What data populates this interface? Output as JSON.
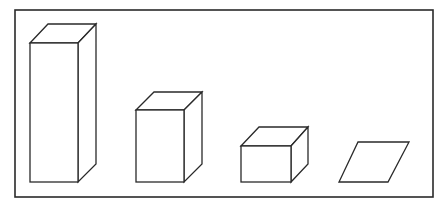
{
  "diagram": {
    "frame": {
      "x": 15,
      "y": 10,
      "width": 418,
      "height": 187
    },
    "line_color": "#2a2a2a",
    "background": "#ffffff",
    "depth_offset": {
      "dx": 18,
      "dy": -18
    },
    "shapes": [
      {
        "name": "tall-prism",
        "front": {
          "x": 30,
          "y": 43,
          "width": 48,
          "height": 139
        }
      },
      {
        "name": "medium-prism",
        "front": {
          "x": 136,
          "y": 110,
          "width": 48,
          "height": 72
        }
      },
      {
        "name": "short-prism",
        "front": {
          "x": 241,
          "y": 146,
          "width": 50,
          "height": 36
        }
      },
      {
        "name": "flat-parallelogram",
        "points": [
          [
            339,
            182
          ],
          [
            388,
            182
          ],
          [
            409,
            142
          ],
          [
            358,
            142
          ]
        ]
      }
    ]
  }
}
